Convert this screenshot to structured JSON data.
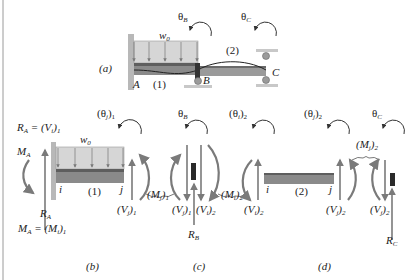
{
  "figure": {
    "panel_a": {
      "caption": "(a)",
      "load_label": "w",
      "load_sub": "0",
      "theta_b": "θ",
      "theta_b_sub": "B",
      "theta_c": "θ",
      "theta_c_sub": "C",
      "point_a": "A",
      "point_b": "B",
      "point_c": "C",
      "member_1": "(1)",
      "member_2": "(2)"
    },
    "panel_b": {
      "caption": "(b)",
      "ra_eq": "R",
      "ra_eq_sub": "A",
      "ra_eq_rhs": " = (V",
      "ra_eq_rhs_sub1": "i",
      "ra_eq_rhs_close": ")",
      "ra_eq_rhs_sub2": "1",
      "ma_label": "M",
      "ma_sub": "A",
      "ra_label": "R",
      "ra_sub": "A",
      "ma_eq": "M",
      "ma_eq_sub": "A",
      "ma_eq_rhs": " = (M",
      "ma_eq_rhs_sub1": "i",
      "ma_eq_rhs_close": ")",
      "ma_eq_rhs_sub2": "1",
      "theta_label": "(θ",
      "theta_sub1": "j",
      "theta_close": ")",
      "theta_sub2": "1",
      "load_label": "w",
      "load_sub": "0",
      "node_i": "i",
      "node_j": "j",
      "member": "(1)",
      "shear_label": "(V",
      "shear_sub1": "j",
      "shear_close": ")",
      "shear_sub2": "1"
    },
    "panel_c": {
      "caption": "(c)",
      "moment_left": "(M",
      "moment_left_sub1": "j",
      "moment_left_close": ")",
      "moment_left_sub2": "1",
      "theta_b": "θ",
      "theta_b_sub": "B",
      "shear_left": "(V",
      "shear_left_sub1": "j",
      "shear_left_close": ")",
      "shear_left_sub2": "1",
      "shear_right": "(V",
      "shear_right_sub1": "i",
      "shear_right_close": ")",
      "shear_right_sub2": "2",
      "reaction": "R",
      "reaction_sub": "B",
      "moment_right": "(M",
      "moment_right_sub1": "i",
      "moment_right_close": ")",
      "moment_right_sub2": "2"
    },
    "panel_d": {
      "caption": "(d)",
      "theta_i": "(θ",
      "theta_i_sub1": "i",
      "theta_i_close": ")",
      "theta_i_sub2": "2",
      "theta_j": "(θ",
      "theta_j_sub1": "j",
      "theta_j_close": ")",
      "theta_j_sub2": "2",
      "theta_c": "θ",
      "theta_c_sub": "C",
      "moment_j": "(M",
      "moment_j_sub1": "j",
      "moment_j_close": ")",
      "moment_j_sub2": "2",
      "shear_i": "(V",
      "shear_i_sub1": "i",
      "shear_i_close": ")",
      "shear_i_sub2": "2",
      "node_i": "i",
      "node_j": "j",
      "member": "(2)",
      "shear_j": "(V",
      "shear_j_sub1": "j",
      "shear_j_close": ")",
      "shear_j_sub2": "2",
      "shear_c": "(V",
      "shear_c_sub1": "j",
      "shear_c_close": ")",
      "shear_c_sub2": "2",
      "reaction": "R",
      "reaction_sub": "C"
    }
  },
  "colors": {
    "arrow_gray": "#7a7a7a",
    "beam_dark": "#6e6e6e",
    "beam_mid": "#9a9a9a",
    "load_fill": "#d6d6d6",
    "wall": "#b8b8b8",
    "support": "#8c8c8c",
    "border": "#9a9a9a"
  }
}
